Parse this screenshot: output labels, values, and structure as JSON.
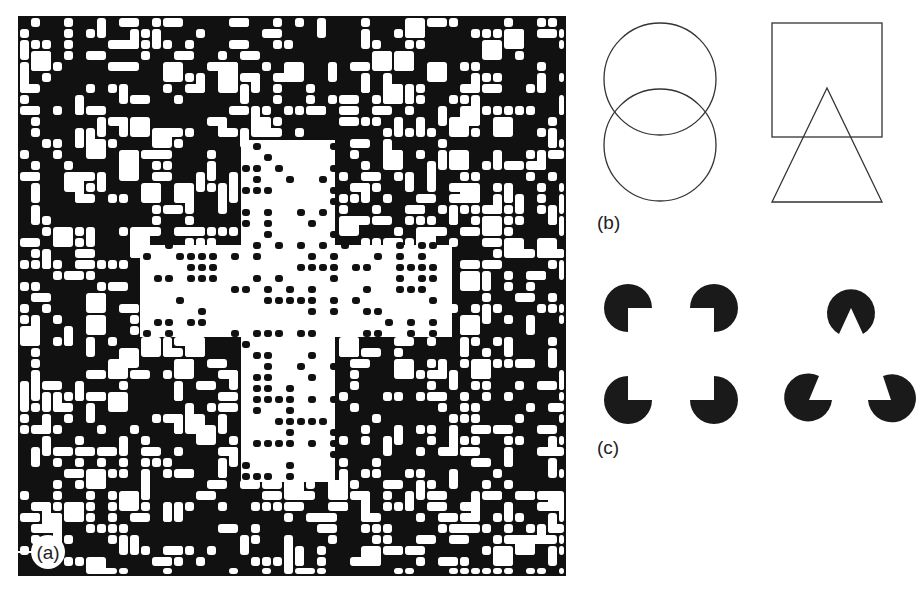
{
  "figure": {
    "panels": [
      {
        "id": "a",
        "label": "(a)",
        "description": "Random black/white dot texture with embedded cross shape of different texture density"
      },
      {
        "id": "b",
        "label": "(b)",
        "description": "Overlapping outline shapes: two intersecting circles; square overlapped by triangle"
      },
      {
        "id": "c",
        "label": "(c)",
        "description": "Kanizsa illusory contours: four pac-man discs forming a square; three pac-man discs forming a triangle"
      }
    ],
    "colors": {
      "ink": "#111111",
      "paper": "#ffffff",
      "stroke": "#333333"
    }
  }
}
